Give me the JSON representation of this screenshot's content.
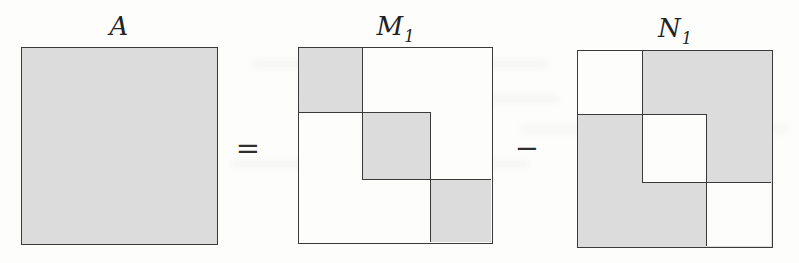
{
  "figure": {
    "labels": {
      "a": {
        "base": "A",
        "sub": ""
      },
      "m1": {
        "base": "M",
        "sub": "1"
      },
      "n1": {
        "base": "N",
        "sub": "1"
      }
    },
    "operators": {
      "equals": "=",
      "minus": "−"
    },
    "colors": {
      "shaded": "#dcdcdc",
      "line": "#3a3a3a",
      "background": "#fdfdfc"
    },
    "matrices": [
      {
        "name": "A",
        "pattern": "entire square shaded"
      },
      {
        "name": "M1",
        "pattern": "three diagonal blocks shaded, off-diagonal white"
      },
      {
        "name": "N1",
        "pattern": "three diagonal blocks white, off-diagonal shaded"
      }
    ]
  }
}
